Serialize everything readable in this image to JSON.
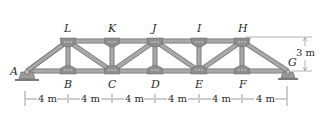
{
  "figure": {
    "type": "truss",
    "colors": {
      "member_fill": "#a8a8a8",
      "member_edge": "#6e6e6e",
      "gusset": "#8e8e8e",
      "support": "#9a9a9a",
      "ground": "#7a7a7a",
      "dim_line": "#444444"
    },
    "nodes": {
      "A": {
        "label": "A",
        "x": 27,
        "y": 71
      },
      "B": {
        "label": "B",
        "x": 68,
        "y": 71
      },
      "C": {
        "label": "C",
        "x": 112,
        "y": 71
      },
      "D": {
        "label": "D",
        "x": 155,
        "y": 71
      },
      "E": {
        "label": "E",
        "x": 199,
        "y": 71
      },
      "F": {
        "label": "F",
        "x": 242,
        "y": 71
      },
      "G": {
        "label": "G",
        "x": 288,
        "y": 71
      },
      "L": {
        "label": "L",
        "x": 68,
        "y": 41
      },
      "K": {
        "label": "K",
        "x": 112,
        "y": 41
      },
      "J": {
        "label": "J",
        "x": 155,
        "y": 41
      },
      "I": {
        "label": "I",
        "x": 199,
        "y": 41
      },
      "H": {
        "label": "H",
        "x": 242,
        "y": 41
      }
    },
    "members": [
      [
        "A",
        "B"
      ],
      [
        "B",
        "C"
      ],
      [
        "C",
        "D"
      ],
      [
        "D",
        "E"
      ],
      [
        "E",
        "F"
      ],
      [
        "F",
        "G"
      ],
      [
        "L",
        "K"
      ],
      [
        "K",
        "J"
      ],
      [
        "J",
        "I"
      ],
      [
        "I",
        "H"
      ],
      [
        "A",
        "L"
      ],
      [
        "H",
        "G"
      ],
      [
        "L",
        "B"
      ],
      [
        "K",
        "C"
      ],
      [
        "J",
        "D"
      ],
      [
        "I",
        "E"
      ],
      [
        "H",
        "F"
      ],
      [
        "L",
        "C"
      ],
      [
        "C",
        "J"
      ],
      [
        "J",
        "E"
      ],
      [
        "E",
        "H"
      ]
    ],
    "dimensions": {
      "panel_labels": [
        "4 m",
        "4 m",
        "4 m",
        "4 m",
        "4 m",
        "4 m"
      ],
      "height_label": "3 m"
    }
  }
}
